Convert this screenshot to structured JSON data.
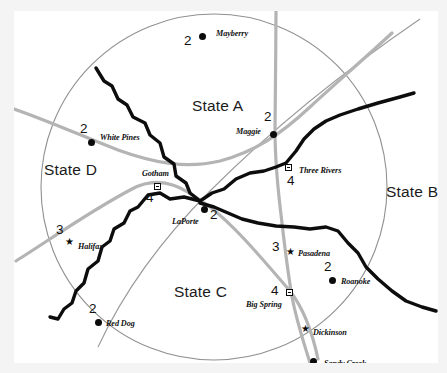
{
  "map": {
    "title": "Regional State Map",
    "background_color": "#ffffff",
    "frame_color": "#f4f4f4",
    "river_color": "#0d0d0d",
    "road_color": "#a8a8a8",
    "boundary_color": "#8c8c8c"
  },
  "states": [
    {
      "label": "State A",
      "x": 178,
      "y": 86
    },
    {
      "label": "State B",
      "x": 372,
      "y": 172
    },
    {
      "label": "State C",
      "x": 160,
      "y": 272
    },
    {
      "label": "State D",
      "x": 30,
      "y": 150
    }
  ],
  "cities": [
    {
      "name": "Mayberry",
      "number": "2",
      "marker": "circle",
      "mx": 185,
      "my": 22,
      "nx": 202,
      "ny": 18,
      "numx": 170,
      "numy": 22
    },
    {
      "name": "Maggie",
      "number": "2",
      "marker": "circle",
      "mx": 256,
      "my": 120,
      "nx": 222,
      "ny": 116,
      "numx": 250,
      "numy": 98
    },
    {
      "name": "Three Rivers",
      "number": "4",
      "marker": "square",
      "mx": 271,
      "my": 153,
      "nx": 285,
      "ny": 155,
      "numx": 273,
      "numy": 162
    },
    {
      "name": "White Pines",
      "number": "2",
      "marker": "circle",
      "mx": 74,
      "my": 128,
      "nx": 86,
      "ny": 122,
      "numx": 66,
      "numy": 110
    },
    {
      "name": "Gotham",
      "number": "4",
      "marker": "square",
      "mx": 140,
      "my": 172,
      "nx": 128,
      "ny": 158,
      "numx": 132,
      "numy": 179
    },
    {
      "name": "LaPorte",
      "number": "2",
      "marker": "circle",
      "mx": 187,
      "my": 195,
      "nx": 158,
      "ny": 206,
      "numx": 196,
      "numy": 196
    },
    {
      "name": "Halifax",
      "number": "3",
      "marker": "star",
      "mx": 51,
      "my": 230,
      "nx": 62,
      "ny": 231,
      "numx": 42,
      "numy": 211
    },
    {
      "name": "Pasadena",
      "number": "3",
      "marker": "star",
      "mx": 272,
      "my": 240,
      "nx": 282,
      "ny": 238,
      "numx": 258,
      "numy": 228
    },
    {
      "name": "Roanoke",
      "number": "2",
      "marker": "circle",
      "mx": 315,
      "my": 266,
      "nx": 327,
      "ny": 266,
      "numx": 310,
      "numy": 248
    },
    {
      "name": "Big Spring",
      "number": "4",
      "marker": "square",
      "mx": 272,
      "my": 278,
      "nx": 232,
      "ny": 289,
      "numx": 257,
      "numy": 272
    },
    {
      "name": "Red Dog",
      "number": "2",
      "marker": "circle",
      "mx": 81,
      "my": 308,
      "nx": 92,
      "ny": 308,
      "numx": 75,
      "numy": 290
    },
    {
      "name": "Dickinson",
      "number": "",
      "marker": "star",
      "mx": 287,
      "my": 317,
      "nx": 299,
      "ny": 317,
      "numx": 0,
      "numy": 0
    },
    {
      "name": "Sandy Creek",
      "number": "",
      "marker": "circle",
      "mx": 296,
      "my": 347,
      "nx": 310,
      "ny": 348,
      "numx": 0,
      "numy": 0
    }
  ],
  "legend_symbols": {
    "circle": "filled-circle-city",
    "square": "square-city",
    "star": "star-city"
  }
}
